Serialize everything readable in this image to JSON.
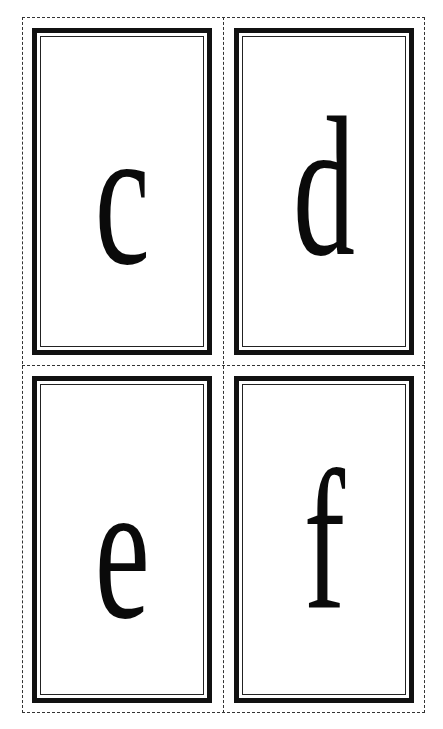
{
  "sheet": {
    "cut_line_style": "dashed",
    "border_color": "#111111"
  },
  "cards": [
    {
      "letter": "c"
    },
    {
      "letter": "d"
    },
    {
      "letter": "e"
    },
    {
      "letter": "f"
    }
  ]
}
